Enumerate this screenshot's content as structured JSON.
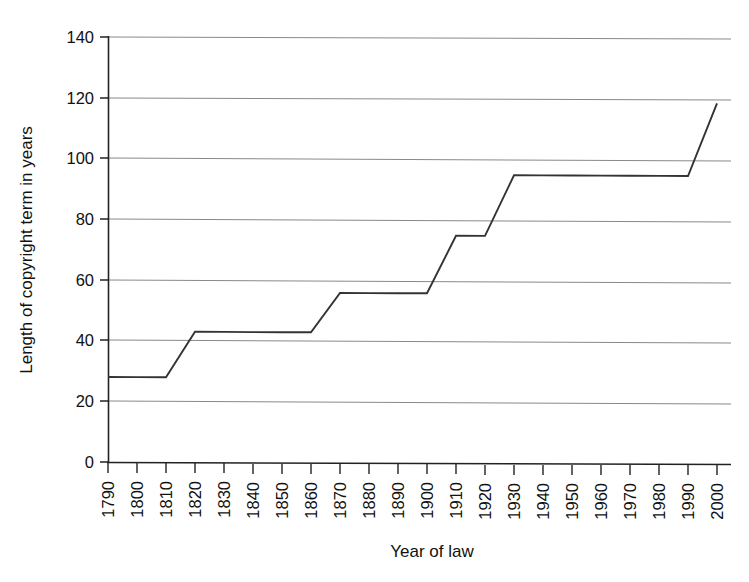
{
  "chart_data": {
    "type": "line",
    "title": "",
    "subtitle": "",
    "xlabel": "Year of law",
    "ylabel": "Length of copyright term in years",
    "xlim": [
      1790,
      2000
    ],
    "ylim": [
      0,
      140
    ],
    "grid": true,
    "grid_axis": "y",
    "legend": false,
    "legend_position": "none",
    "line_color": "#333333",
    "background_color": "#ffffff",
    "xticks": [
      "1790",
      "1800",
      "1810",
      "1820",
      "1830",
      "1840",
      "1850",
      "1860",
      "1870",
      "1880",
      "1890",
      "1900",
      "1910",
      "1920",
      "1930",
      "1940",
      "1950",
      "1960",
      "1970",
      "1980",
      "1990",
      "2000"
    ],
    "xtick_rotation": -90,
    "yticks": [
      "0",
      "20",
      "40",
      "60",
      "80",
      "100",
      "120",
      "140"
    ],
    "x": [
      1790,
      1800,
      1810,
      1820,
      1830,
      1840,
      1850,
      1860,
      1870,
      1880,
      1890,
      1900,
      1910,
      1920,
      1930,
      1940,
      1950,
      1960,
      1970,
      1980,
      1990,
      2000
    ],
    "values": [
      28,
      28,
      28,
      43,
      43,
      43,
      43,
      43,
      56,
      56,
      56,
      56,
      75,
      75,
      95,
      95,
      95,
      95,
      95,
      95,
      95,
      119
    ],
    "series": [
      {
        "name": "Length of copyright term in years",
        "values": [
          28,
          28,
          28,
          43,
          43,
          43,
          43,
          43,
          56,
          56,
          56,
          56,
          75,
          75,
          95,
          95,
          95,
          95,
          95,
          95,
          95,
          119
        ]
      }
    ],
    "annotations": []
  }
}
